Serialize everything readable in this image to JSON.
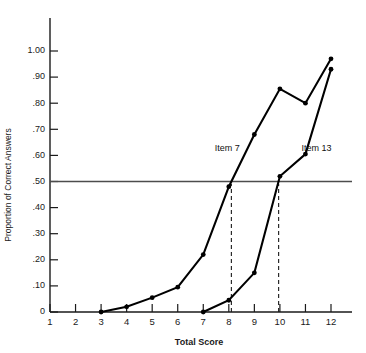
{
  "chart_data": {
    "type": "line",
    "title": "",
    "subtitle": "",
    "xlabel": "Total Score",
    "ylabel": "Proportion of Correct Answers",
    "xlim": [
      1,
      12
    ],
    "ylim": [
      0,
      1.0
    ],
    "grid": false,
    "legend_position": "inline-annotation",
    "x_ticks": [
      1,
      2,
      3,
      4,
      5,
      6,
      7,
      8,
      9,
      10,
      11,
      12
    ],
    "x_tick_labels": [
      "1",
      "2",
      "3",
      "4",
      "5",
      "6",
      "7",
      "8",
      "9",
      "10",
      "11",
      "12"
    ],
    "y_ticks": [
      0,
      0.1,
      0.2,
      0.3,
      0.4,
      0.5,
      0.6,
      0.7,
      0.8,
      0.9,
      1.0
    ],
    "y_tick_labels": [
      "0",
      ".10",
      ".20",
      ".30",
      ".40",
      ".50",
      ".60",
      ".70",
      ".80",
      ".90",
      "1.00"
    ],
    "series": [
      {
        "name": "Item 7",
        "label": "Item 7",
        "color": "#000000",
        "x": [
          3,
          4,
          5,
          6,
          7,
          8,
          9,
          10,
          11,
          12
        ],
        "values": [
          0.0,
          0.02,
          0.055,
          0.095,
          0.22,
          0.48,
          0.68,
          0.855,
          0.8,
          0.97
        ]
      },
      {
        "name": "Item 13",
        "label": "Item 13",
        "color": "#000000",
        "x": [
          7,
          8,
          9,
          10,
          11,
          12
        ],
        "values": [
          0.0,
          0.045,
          0.15,
          0.52,
          0.605,
          0.93
        ]
      }
    ],
    "reference_lines": [
      {
        "name": "median-threshold",
        "orientation": "horizontal",
        "value": 0.5
      }
    ],
    "annotations": [
      {
        "name": "item7-dropline",
        "orientation": "vertical",
        "x": 8.1,
        "from": 0.0,
        "to": 0.49
      },
      {
        "name": "item13-dropline",
        "orientation": "vertical",
        "x": 9.95,
        "from": 0.0,
        "to": 0.49
      }
    ],
    "series_label_positions": [
      {
        "name": "Item 7",
        "x": 7.45,
        "y": 0.615
      },
      {
        "name": "Item 13",
        "x": 10.85,
        "y": 0.615
      }
    ]
  }
}
